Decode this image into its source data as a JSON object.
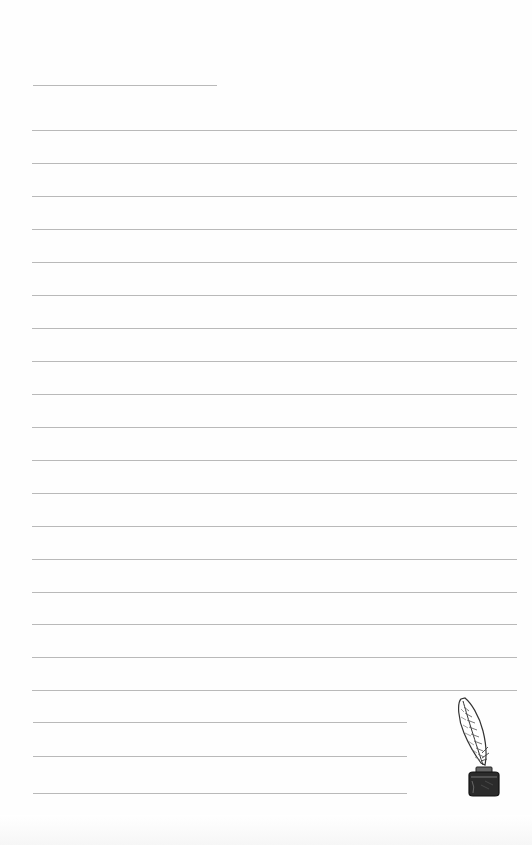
{
  "document": {
    "type": "lined-writing-paper",
    "background_color": "#fefefe",
    "line_color": "#b9b9b9",
    "header_line": {
      "x1": 33,
      "x2": 217,
      "y": 85
    },
    "full_lines": {
      "x1": 32,
      "x2": 517,
      "y": [
        130,
        163,
        196,
        229,
        262,
        295,
        328,
        361,
        394,
        427,
        460,
        493,
        526,
        559,
        592,
        624,
        657,
        690
      ]
    },
    "short_lines": {
      "x1": 33,
      "x2": 407,
      "y": [
        722,
        756,
        793
      ]
    },
    "decoration": {
      "icon": "quill-and-inkwell-icon",
      "position": "bottom-right"
    }
  }
}
